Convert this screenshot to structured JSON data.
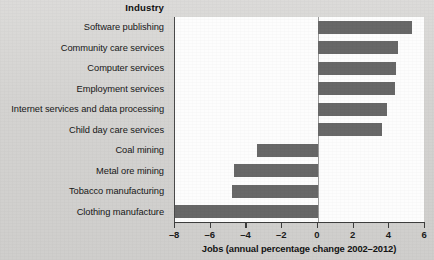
{
  "chart_data": {
    "type": "bar",
    "orientation": "horizontal",
    "title": "",
    "category_axis_title": "Industry",
    "xlabel": "Jobs (annual percentage change 2002–2012)",
    "ylabel": "",
    "xlim": [
      -8,
      6
    ],
    "xticks": [
      -8,
      -6,
      -4,
      -2,
      0,
      2,
      4,
      6
    ],
    "xtick_labels": [
      "–8",
      "–6",
      "–4",
      "–2",
      "0",
      "2",
      "4",
      "6"
    ],
    "grid": false,
    "legend": false,
    "bar_color": "#686868",
    "plot_background": "#fdfdfd",
    "figure_background": "#d6d5d3",
    "categories": [
      "Software publishing",
      "Community care services",
      "Computer services",
      "Employment services",
      "Internet services and data processing",
      "Child day care services",
      "Coal mining",
      "Metal ore mining",
      "Tobacco manufacturing",
      "Clothing manufacture"
    ],
    "values": [
      5.3,
      4.5,
      4.4,
      4.3,
      3.9,
      3.6,
      -3.4,
      -4.7,
      -4.8,
      -8.0
    ]
  }
}
